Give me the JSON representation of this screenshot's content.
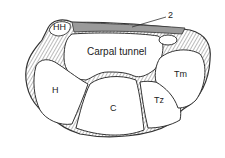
{
  "diagram": {
    "labels": {
      "hh": "HH",
      "ligament": "2",
      "tunnel": "Carpal tunnel",
      "h": "H",
      "c": "C",
      "tz": "Tz",
      "tm": "Tm"
    },
    "colors": {
      "outline": "#333333",
      "shade": "#9a9a9a",
      "bone_fill": "#ffffff",
      "hatch": "#666666"
    }
  }
}
